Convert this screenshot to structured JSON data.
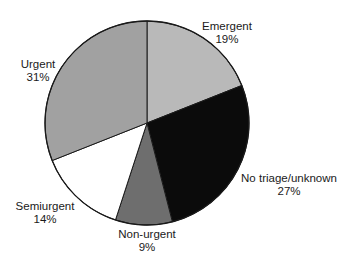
{
  "chart_data": {
    "type": "pie",
    "title": "",
    "start_angle_deg": 0,
    "direction": "clockwise",
    "categories": [
      "Emergent",
      "No triage/unknown",
      "Non-urgent",
      "Semiurgent",
      "Urgent"
    ],
    "values": [
      19,
      27,
      9,
      14,
      31
    ],
    "value_labels": [
      "19%",
      "27%",
      "9%",
      "14%",
      "31%"
    ],
    "colors": [
      "#b9b9b9",
      "#0b0b0b",
      "#6e6e6e",
      "#ffffff",
      "#a1a1a1"
    ],
    "legend": "none",
    "labels_position": "outside"
  },
  "labels": [
    {
      "name": "Emergent",
      "pct": "19%",
      "x": 227,
      "y": 20
    },
    {
      "name": "No triage/unknown",
      "pct": "27%",
      "x": 289,
      "y": 172
    },
    {
      "name": "Non-urgent",
      "pct": "9%",
      "x": 147,
      "y": 228
    },
    {
      "name": "Semiurgent",
      "pct": "14%",
      "x": 45,
      "y": 200
    },
    {
      "name": "Urgent",
      "pct": "31%",
      "x": 38,
      "y": 58
    }
  ]
}
